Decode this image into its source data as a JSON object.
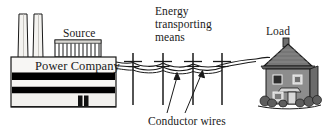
{
  "diagram": {
    "title_labels": {
      "source": "Source",
      "power_company": "Power Company",
      "energy_means_line1": "Energy",
      "energy_means_line2": "transporting",
      "energy_means_line3": "means",
      "load": "Load",
      "conductor_wires": "Conductor wires"
    },
    "colors": {
      "ink": "#1a1a1a",
      "building_fill": "#f0efec",
      "band_dark": "#000000",
      "stack_fill": "#f4f3f0",
      "roof_gray": "#767676",
      "wall_gray": "#8d8d8d",
      "window_dark": "#2b2b2b",
      "bush_gray": "#5e5e5e",
      "wire": "#1a1a1a"
    },
    "elements": {
      "smokestack_count": 2,
      "louver_slat_count": 11,
      "utility_pole_count": 4,
      "pole_x_positions": [
        133,
        163,
        193,
        222
      ],
      "conductor_wire_count": 3,
      "building_bands": 2,
      "house_windows": 4,
      "house_doors": 1,
      "leader_arrows": 2
    }
  }
}
